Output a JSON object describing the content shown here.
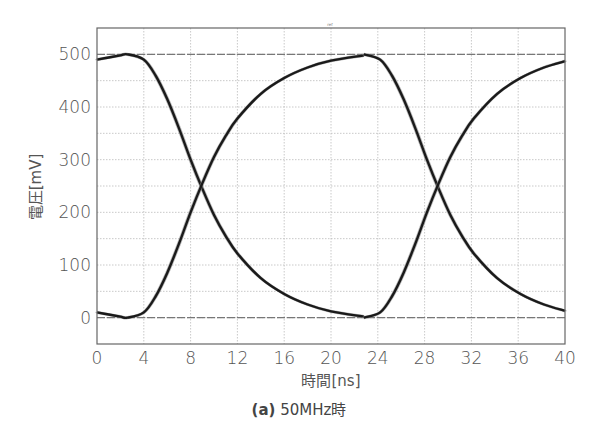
{
  "caption": {
    "tag": "(a)",
    "text": " 50MHz時"
  },
  "top_marker": "ref",
  "chart_data": {
    "type": "line",
    "title": "",
    "xlabel": "時間[ns]",
    "ylabel": "電圧[mV]",
    "xlim": [
      0,
      40
    ],
    "ylim": [
      -50,
      550
    ],
    "xticks": [
      0,
      4,
      8,
      12,
      16,
      20,
      24,
      28,
      32,
      36,
      40
    ],
    "yticks": [
      0,
      100,
      200,
      300,
      400,
      500
    ],
    "grid": true,
    "minor_y_grid_step": 50,
    "legend": null,
    "reference_lines_mV": [
      0,
      500
    ],
    "series": [
      {
        "name": "falling-edge-1",
        "x": [
          0,
          1,
          2,
          2.6,
          4,
          5,
          6,
          7,
          8,
          9,
          10,
          11,
          12,
          14,
          16,
          18,
          20,
          22.8
        ],
        "y": [
          490,
          494,
          498,
          500,
          490,
          460,
          415,
          360,
          300,
          245,
          195,
          155,
          122,
          75,
          45,
          25,
          12,
          2
        ]
      },
      {
        "name": "rising-edge-1",
        "x": [
          0,
          1,
          2,
          2.6,
          4,
          5,
          6,
          7,
          8,
          9,
          10,
          11,
          12,
          14,
          16,
          18,
          20,
          22.8
        ],
        "y": [
          10,
          6,
          2,
          0,
          10,
          40,
          85,
          140,
          200,
          255,
          305,
          345,
          378,
          425,
          455,
          475,
          488,
          498
        ]
      },
      {
        "name": "falling-edge-2",
        "x": [
          22.8,
          24.2,
          25.2,
          26.2,
          27.2,
          28.2,
          29.2,
          30.2,
          31.2,
          32.2,
          34.2,
          36.2,
          38.2,
          40
        ],
        "y": [
          500,
          490,
          460,
          415,
          360,
          300,
          245,
          195,
          155,
          122,
          75,
          45,
          25,
          13
        ]
      },
      {
        "name": "rising-edge-2",
        "x": [
          22.8,
          24.2,
          25.2,
          26.2,
          27.2,
          28.2,
          29.2,
          30.2,
          31.2,
          32.2,
          34.2,
          36.2,
          38.2,
          40
        ],
        "y": [
          0,
          10,
          40,
          85,
          140,
          200,
          255,
          305,
          345,
          378,
          425,
          455,
          475,
          487
        ]
      }
    ],
    "crossings": [
      {
        "x_ns": 9.0,
        "y_mV": 245
      },
      {
        "x_ns": 29.2,
        "y_mV": 245
      }
    ],
    "colors": {
      "trace": "#1a1a1a",
      "trace_halo": "#888888",
      "grid": "#bbbbbb",
      "frame": "#666666",
      "ref_line": "#777777"
    }
  }
}
